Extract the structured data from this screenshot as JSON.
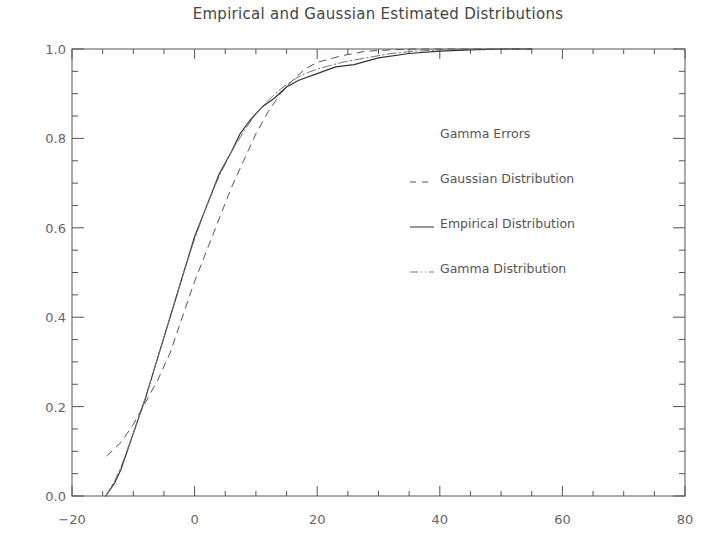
{
  "chart_data": {
    "type": "line",
    "title": "Empirical and Gaussian Estimated Distributions",
    "xlabel": "",
    "ylabel": "",
    "xlim": [
      -20,
      80
    ],
    "ylim": [
      0.0,
      1.0
    ],
    "grid": false,
    "x_ticks": [
      -20,
      0,
      20,
      40,
      60,
      80
    ],
    "x_tick_labels": [
      "-20",
      "0",
      "20",
      "40",
      "60",
      "80"
    ],
    "x_minor_step": 5,
    "y_ticks": [
      0.0,
      0.2,
      0.4,
      0.6,
      0.8,
      1.0
    ],
    "y_tick_labels": [
      "0.0",
      "0.2",
      "0.4",
      "0.6",
      "0.8",
      "1.0"
    ],
    "y_minor_step": 0.05,
    "legend": {
      "title": "Gamma Errors",
      "position": "upper-right-inside",
      "entries": [
        "Gaussian Distribution",
        "Empirical Distribution",
        "Gamma Distribution"
      ]
    },
    "series": [
      {
        "name": "Gaussian Distribution",
        "style": "dashed",
        "color": "#555555",
        "x": [
          -14.3,
          -12,
          -10,
          -8,
          -6,
          -4,
          -2,
          0,
          2,
          4,
          6,
          8,
          10,
          12,
          14,
          16,
          18,
          20,
          24,
          28,
          32,
          36,
          40,
          45,
          50,
          55
        ],
        "y": [
          0.09,
          0.12,
          0.16,
          0.21,
          0.26,
          0.32,
          0.4,
          0.48,
          0.55,
          0.62,
          0.69,
          0.75,
          0.81,
          0.86,
          0.9,
          0.93,
          0.955,
          0.97,
          0.985,
          0.995,
          0.998,
          1.0,
          1.0,
          1.0,
          1.0,
          1.0
        ]
      },
      {
        "name": "Empirical Distribution",
        "style": "solid",
        "color": "#333333",
        "x": [
          -14.5,
          -13,
          -12,
          -10,
          -8,
          -6,
          -4,
          -2,
          0,
          2,
          4,
          6,
          7.4,
          9,
          11,
          13,
          15,
          17,
          20,
          23,
          26,
          30,
          35,
          40,
          45,
          50,
          55
        ],
        "y": [
          0.0,
          0.03,
          0.06,
          0.14,
          0.22,
          0.31,
          0.4,
          0.49,
          0.58,
          0.65,
          0.72,
          0.77,
          0.81,
          0.84,
          0.87,
          0.89,
          0.915,
          0.93,
          0.945,
          0.96,
          0.965,
          0.98,
          0.99,
          0.995,
          0.998,
          1.0,
          1.0
        ]
      },
      {
        "name": "Gamma Distribution",
        "style": "dash-dot",
        "color": "#777777",
        "x": [
          -14.5,
          -13,
          -12,
          -10,
          -8,
          -6,
          -4,
          -2,
          0,
          2,
          4,
          6,
          8,
          10,
          12,
          14,
          16,
          18,
          20,
          24,
          28,
          32,
          36,
          40,
          45,
          50,
          55
        ],
        "y": [
          0.0,
          0.035,
          0.065,
          0.14,
          0.22,
          0.31,
          0.4,
          0.49,
          0.575,
          0.65,
          0.715,
          0.77,
          0.815,
          0.855,
          0.885,
          0.91,
          0.93,
          0.945,
          0.955,
          0.97,
          0.98,
          0.99,
          0.995,
          0.998,
          1.0,
          1.0,
          1.0
        ]
      }
    ]
  },
  "colors": {
    "background": "#ffffff",
    "axis": "#555555",
    "text": "#555555"
  }
}
